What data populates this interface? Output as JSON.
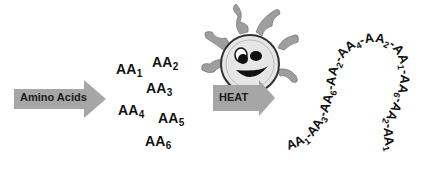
{
  "arrows": {
    "amino_acids": "Amino Acids",
    "heat": "HEAT"
  },
  "free_amino_acids": [
    {
      "base": "AA",
      "sub": "1"
    },
    {
      "base": "AA",
      "sub": "2"
    },
    {
      "base": "AA",
      "sub": "3"
    },
    {
      "base": "AA",
      "sub": "4"
    },
    {
      "base": "AA",
      "sub": "5"
    },
    {
      "base": "AA",
      "sub": "6"
    }
  ],
  "chain": {
    "sequence": [
      "AA1",
      "AA3",
      "AA6",
      "AA2",
      "AA4",
      "AA2",
      "AA1",
      "AA6",
      "AA2",
      "AA1"
    ]
  },
  "colors": {
    "arrow_fill": "#a6a6a6",
    "sun_ray": "#9e9e9e",
    "sun_face": "#e6e6e6",
    "ink": "#111111"
  }
}
